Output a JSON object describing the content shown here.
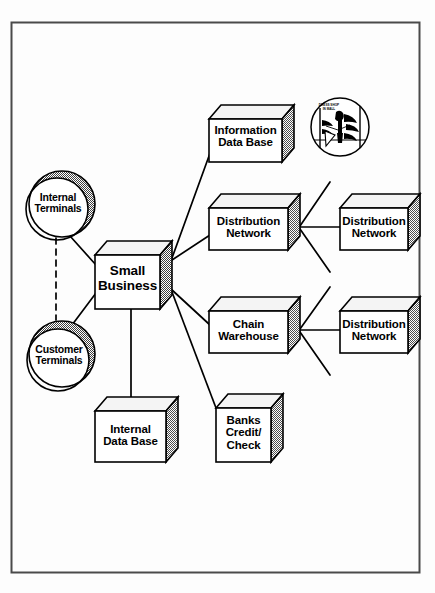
{
  "diagram": {
    "frame": {
      "border_color": "#4a4a4a"
    },
    "colors": {
      "outline": "#000000",
      "box_face": "#ffffff",
      "box_top": "#f2f2f2",
      "box_side_shade": "#8c8c8c",
      "circle_shade": "#7d7d7d",
      "link": "#000000",
      "page_background": "#ffffff"
    },
    "nodes": [
      {
        "id": "information-data-base",
        "type": "box3d",
        "label": "Information\nData Base"
      },
      {
        "id": "distribution-network-upper-left",
        "type": "box3d",
        "label": "Distribution\nNetwork"
      },
      {
        "id": "distribution-network-upper-right",
        "type": "box3d",
        "label": "Distribution\nNetwork"
      },
      {
        "id": "chain-warehouse",
        "type": "box3d",
        "label": "Chain\nWarehouse"
      },
      {
        "id": "distribution-network-lower-right",
        "type": "box3d",
        "label": "Distribution\nNetwork"
      },
      {
        "id": "banks-credit-check",
        "type": "box3d",
        "label": "Banks\nCredit/\nCheck"
      },
      {
        "id": "internal-data-base",
        "type": "box3d",
        "label": "Internal\nData Base"
      },
      {
        "id": "small-business",
        "type": "box3d",
        "label": "Small\nBusiness"
      },
      {
        "id": "internal-terminals",
        "type": "circle",
        "label": "Internal\nTerminals"
      },
      {
        "id": "customer-terminals",
        "type": "circle",
        "label": "Customer\nTerminals"
      }
    ],
    "vignette": {
      "id": "dress-shop-in-mall-illustration",
      "caption": "DRESS SHOP\nIN MALL",
      "description": "circular line-art vignette of a shop front with mannequins"
    },
    "links": [
      {
        "from": "small-business",
        "to": "information-data-base",
        "style": "solid"
      },
      {
        "from": "small-business",
        "to": "distribution-network-upper-left",
        "style": "solid"
      },
      {
        "from": "small-business",
        "to": "chain-warehouse",
        "style": "solid"
      },
      {
        "from": "small-business",
        "to": "banks-credit-check",
        "style": "solid"
      },
      {
        "from": "small-business",
        "to": "internal-data-base",
        "style": "solid"
      },
      {
        "from": "small-business",
        "to": "internal-terminals",
        "style": "solid"
      },
      {
        "from": "small-business",
        "to": "customer-terminals",
        "style": "solid"
      },
      {
        "from": "internal-terminals",
        "to": "customer-terminals",
        "style": "dashed"
      },
      {
        "from": "distribution-network-upper-left",
        "to": "distribution-network-upper-right",
        "style": "solid"
      },
      {
        "from": "distribution-network-upper-left",
        "to": "spur-up-right",
        "style": "solid"
      },
      {
        "from": "distribution-network-upper-left",
        "to": "spur-down-right",
        "style": "solid"
      },
      {
        "from": "chain-warehouse",
        "to": "distribution-network-lower-right",
        "style": "solid"
      },
      {
        "from": "chain-warehouse",
        "to": "spur-up-right-2",
        "style": "solid"
      },
      {
        "from": "chain-warehouse",
        "to": "spur-down-right-2",
        "style": "solid"
      }
    ]
  }
}
